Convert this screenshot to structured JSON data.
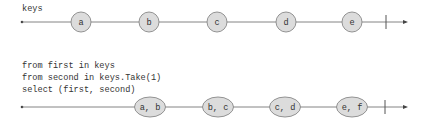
{
  "colors": {
    "line": "#666666",
    "node_fill": "#dcdcdc",
    "node_stroke": "#888888",
    "text": "#333333"
  },
  "top_stream": {
    "label": "keys",
    "marbles": [
      "a",
      "b",
      "c",
      "d",
      "e"
    ]
  },
  "query": {
    "lines": [
      "from first in keys",
      "from second in keys.Take(1)",
      "select (first, second)"
    ]
  },
  "bottom_stream": {
    "marbles": [
      "a, b",
      "b, c",
      "c, d",
      "e, f"
    ]
  }
}
